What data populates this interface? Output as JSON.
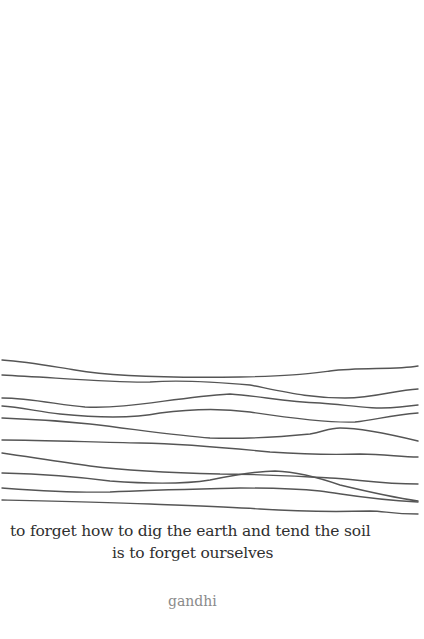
{
  "poem": {
    "lines": [
      "to forget how to dig the earth and tend the soil",
      "is to forget ourselves"
    ],
    "author": "gandhi"
  },
  "illustration": {
    "description": "ten hand-drawn wavy horizontal lines",
    "stroke_color": "#555555",
    "line_count": 10
  },
  "colors": {
    "background": "#ffffff",
    "text": "#2f2f2f",
    "author": "#8a8a8a"
  }
}
